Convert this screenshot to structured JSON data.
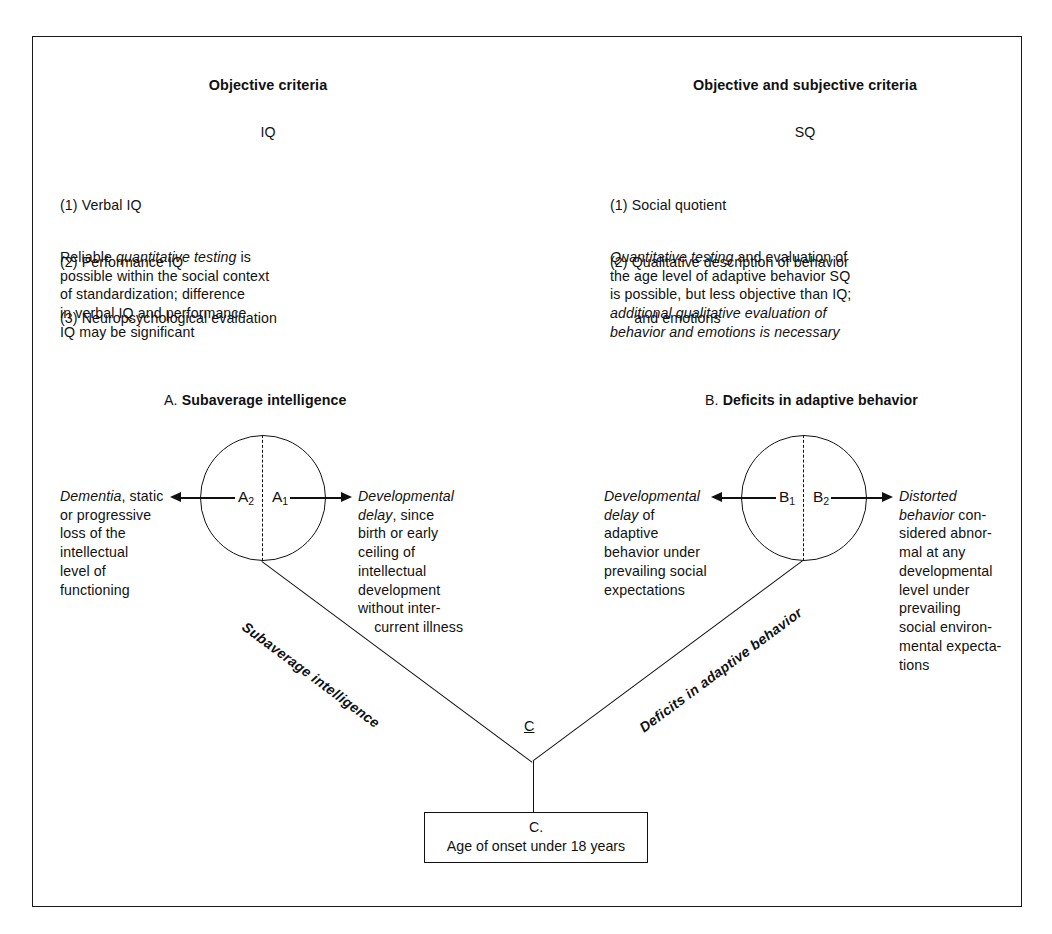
{
  "figure": {
    "columns": [
      {
        "id": "iq",
        "header": "Objective criteria",
        "measure": "IQ",
        "items": [
          "(1) Verbal IQ",
          "(2) Performance IQ",
          "(3) Neuropsychological evaluation"
        ],
        "note_plain_1": "Reliable ",
        "note_italic_1": "quantitative testing",
        "note_plain_2": " is\npossible within the social context\nof standardization; difference\nin verbal IQ and performance\nIQ may be significant"
      },
      {
        "id": "sq",
        "header": "Objective and subjective criteria",
        "measure": "SQ",
        "items": [
          "(1) Social quotient",
          "(2) Qualitative description of behavior",
          "      and emotions"
        ],
        "note_italic_1": "Quantitative testing",
        "note_plain_1": " and evaluation of\nthe age level of adaptive behavior SQ\nis possible, but less objective than IQ;\n",
        "note_italic_2": "additional qualitative evaluation of\nbehavior and emotions is necessary"
      }
    ],
    "sections": [
      {
        "id": "a",
        "prefix": "A.",
        "title": "Subaverage intelligence",
        "left_node": "A",
        "left_node_sub": "2",
        "right_node": "A",
        "right_node_sub": "1",
        "left_text_italic": "Dementia",
        "left_text_plain": ", static\nor progressive\nloss of the\nintellectual\nlevel of\nfunctioning",
        "right_text_italic": "Developmental\ndelay",
        "right_text_plain": ", since\nbirth or early\nceiling of\nintellectual\ndevelopment\nwithout inter-\n    current illness",
        "branch_label": "Subaverage intelligence"
      },
      {
        "id": "b",
        "prefix": "B.",
        "title": "Deficits in adaptive behavior",
        "left_node": "B",
        "left_node_sub": "1",
        "right_node": "B",
        "right_node_sub": "2",
        "left_text_italic": "Developmental\ndelay",
        "left_text_plain": " of\nadaptive\nbehavior under\nprevailing social\nexpectations",
        "right_text_italic": "Distorted\nbehavior",
        "right_text_plain": " con-\nsidered abnor-\nmal at any\ndevelopmental\nlevel under\nprevailing\nsocial environ-\nmental expecta-\ntions",
        "branch_label": "Deficits in adaptive behavior"
      }
    ],
    "junction_label": "C",
    "onset_box": {
      "line1": "C.",
      "line2": "Age of onset under 18 years"
    },
    "colors": {
      "ink": "#111111",
      "paper": "#ffffff"
    }
  }
}
